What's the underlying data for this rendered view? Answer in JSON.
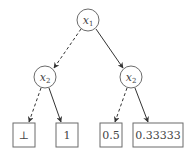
{
  "diagram": {
    "type": "decision-diagram",
    "nodes": [
      {
        "id": "root",
        "var": "x",
        "sub": "1",
        "cx": 88,
        "cy": 20
      },
      {
        "id": "left",
        "var": "x",
        "sub": "2",
        "cx": 45,
        "cy": 77
      },
      {
        "id": "right",
        "var": "x",
        "sub": "2",
        "cx": 131,
        "cy": 77
      }
    ],
    "leaves": [
      {
        "id": "leaf1",
        "label": "⊥"
      },
      {
        "id": "leaf2",
        "label": "1"
      },
      {
        "id": "leaf3",
        "label": "0.5"
      },
      {
        "id": "leaf4",
        "label": "0.33333"
      }
    ],
    "edges": [
      {
        "from": "root",
        "to": "left",
        "style": "dashed"
      },
      {
        "from": "root",
        "to": "right",
        "style": "solid"
      },
      {
        "from": "left",
        "to": "leaf1",
        "style": "dashed"
      },
      {
        "from": "left",
        "to": "leaf2",
        "style": "solid"
      },
      {
        "from": "right",
        "to": "leaf3",
        "style": "dashed"
      },
      {
        "from": "right",
        "to": "leaf4",
        "style": "solid"
      }
    ],
    "colors": {
      "stroke": "#6b6b6b",
      "edge": "#333333",
      "text": "#444444"
    }
  }
}
